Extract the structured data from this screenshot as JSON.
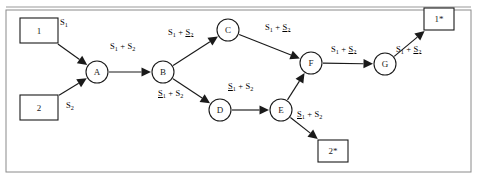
{
  "figure": {
    "type": "network-flow-diagram",
    "width": 477,
    "height": 180,
    "colors": {
      "stroke": "#1a1a1a",
      "frame": "#8a8a8a",
      "background": "#ffffff"
    }
  },
  "source_boxes": [
    {
      "id": "src1",
      "label": "1",
      "x": 20,
      "y": 18,
      "w": 38,
      "h": 25
    },
    {
      "id": "src2",
      "label": "2",
      "x": 20,
      "y": 95,
      "w": 38,
      "h": 25
    }
  ],
  "sink_boxes": [
    {
      "id": "dst1",
      "label": "1*",
      "x": 424,
      "y": 8,
      "w": 30,
      "h": 22
    },
    {
      "id": "dst2",
      "label": "2*",
      "x": 318,
      "y": 140,
      "w": 30,
      "h": 22
    }
  ],
  "nodes": [
    {
      "id": "A",
      "label": "A",
      "cx": 97,
      "cy": 72,
      "r": 11
    },
    {
      "id": "B",
      "label": "B",
      "cx": 163,
      "cy": 72,
      "r": 11
    },
    {
      "id": "C",
      "label": "C",
      "cx": 228,
      "cy": 30,
      "r": 11
    },
    {
      "id": "D",
      "label": "D",
      "cx": 220,
      "cy": 110,
      "r": 11
    },
    {
      "id": "E",
      "label": "E",
      "cx": 281,
      "cy": 110,
      "r": 11
    },
    {
      "id": "F",
      "label": "F",
      "cx": 311,
      "cy": 63,
      "r": 11
    },
    {
      "id": "G",
      "label": "G",
      "cx": 385,
      "cy": 64,
      "r": 11
    }
  ],
  "edges": [
    {
      "id": "src1-A",
      "from": "src1",
      "to": "A",
      "label": {
        "terms": [
          {
            "text": "S",
            "sub": "1",
            "underline": false
          }
        ],
        "plus": false
      },
      "label_x": 60,
      "label_y": 18
    },
    {
      "id": "src2-A",
      "from": "src2",
      "to": "A",
      "label": {
        "terms": [
          {
            "text": "S",
            "sub": "2",
            "underline": false
          }
        ],
        "plus": false
      },
      "label_x": 66,
      "label_y": 101
    },
    {
      "id": "A-B",
      "from": "A",
      "to": "B",
      "label": {
        "terms": [
          {
            "text": "S",
            "sub": "1",
            "underline": false
          },
          {
            "text": "S",
            "sub": "2",
            "underline": false
          }
        ],
        "plus": true
      },
      "label_x": 110,
      "label_y": 42
    },
    {
      "id": "B-C",
      "from": "B",
      "to": "C",
      "label": {
        "terms": [
          {
            "text": "S",
            "sub": "1",
            "underline": false
          },
          {
            "text": "S",
            "sub": "2",
            "underline": true
          }
        ],
        "plus": true
      },
      "label_x": 168,
      "label_y": 28
    },
    {
      "id": "B-D",
      "from": "B",
      "to": "D",
      "label": {
        "terms": [
          {
            "text": "S",
            "sub": "1",
            "underline": true
          },
          {
            "text": "S",
            "sub": "2",
            "underline": false
          }
        ],
        "plus": true
      },
      "label_x": 158,
      "label_y": 89
    },
    {
      "id": "C-F",
      "from": "C",
      "to": "F",
      "label": {
        "terms": [
          {
            "text": "S",
            "sub": "1",
            "underline": false
          },
          {
            "text": "S",
            "sub": "2",
            "underline": true
          }
        ],
        "plus": true
      },
      "label_x": 265,
      "label_y": 23
    },
    {
      "id": "D-E",
      "from": "D",
      "to": "E",
      "label": {
        "terms": [
          {
            "text": "S",
            "sub": "1",
            "underline": true
          },
          {
            "text": "S",
            "sub": "2",
            "underline": false
          }
        ],
        "plus": true
      },
      "label_x": 228,
      "label_y": 82
    },
    {
      "id": "E-F",
      "from": "E",
      "to": "F",
      "label": null,
      "label_x": 0,
      "label_y": 0
    },
    {
      "id": "F-G",
      "from": "F",
      "to": "G",
      "label": {
        "terms": [
          {
            "text": "S",
            "sub": "1",
            "underline": false
          },
          {
            "text": "S",
            "sub": "2",
            "underline": true
          }
        ],
        "plus": true
      },
      "label_x": 331,
      "label_y": 45
    },
    {
      "id": "G-dst1",
      "from": "G",
      "to": "dst1",
      "label": {
        "terms": [
          {
            "text": "S",
            "sub": "1",
            "underline": false
          },
          {
            "text": "S",
            "sub": "2",
            "underline": true
          }
        ],
        "plus": true
      },
      "label_x": 396,
      "label_y": 45
    },
    {
      "id": "E-dst2",
      "from": "E",
      "to": "dst2",
      "label": {
        "terms": [
          {
            "text": "S",
            "sub": "1",
            "underline": true
          },
          {
            "text": "S",
            "sub": "2",
            "underline": false
          }
        ],
        "plus": true
      },
      "label_x": 297,
      "label_y": 110
    }
  ]
}
